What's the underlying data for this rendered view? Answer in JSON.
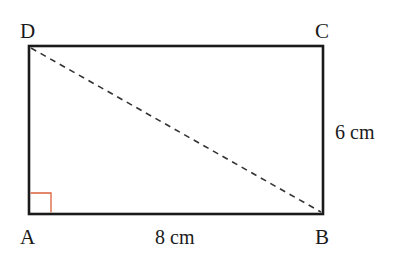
{
  "diagram": {
    "type": "rectangle-with-diagonal",
    "vertices": [
      {
        "label": "A",
        "position": "bottom-left"
      },
      {
        "label": "B",
        "position": "bottom-right"
      },
      {
        "label": "C",
        "position": "top-right"
      },
      {
        "label": "D",
        "position": "top-left"
      }
    ],
    "dimensions": {
      "width_label": "8 cm",
      "height_label": "6 cm"
    },
    "diagonal": {
      "from": "D",
      "to": "B",
      "style": "dashed"
    },
    "right_angle_marker": {
      "at": "A",
      "color": "#d9603a"
    },
    "colors": {
      "outline": "#1a1a1a",
      "diagonal": "#333333",
      "right_angle": "#d9603a"
    }
  }
}
